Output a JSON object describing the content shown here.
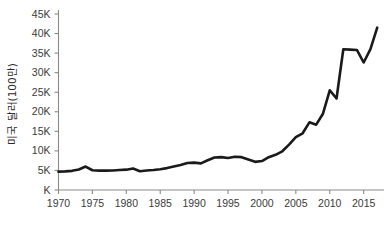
{
  "chart_data": {
    "type": "line",
    "title": "",
    "subtitle": "",
    "xlabel": "",
    "ylabel": "미국 달러(100만)",
    "xlim": [
      1970,
      2018
    ],
    "ylim": [
      0,
      45000
    ],
    "grid": false,
    "legend": false,
    "legend_position": "none",
    "line_color": "#1a1a1a",
    "axis_color": "#8a8a8a",
    "text_color": "#3a3a3a",
    "background_color": "#ffffff",
    "x_tick_labels": [
      "1970",
      "1975",
      "1980",
      "1985",
      "1990",
      "1995",
      "2000",
      "2005",
      "2010",
      "2015"
    ],
    "x_tick_values": [
      1970,
      1975,
      1980,
      1985,
      1990,
      1995,
      2000,
      2005,
      2010,
      2015
    ],
    "y_tick_labels": [
      "K",
      "5K",
      "10K",
      "15K",
      "20K",
      "25K",
      "30K",
      "35K",
      "40K",
      "45K"
    ],
    "y_tick_values": [
      0,
      5000,
      10000,
      15000,
      20000,
      25000,
      30000,
      35000,
      40000,
      45000
    ],
    "series": [
      {
        "name": "미국 달러(100만)",
        "x": [
          1970,
          1971,
          1972,
          1973,
          1974,
          1975,
          1976,
          1977,
          1978,
          1979,
          1980,
          1981,
          1982,
          1983,
          1984,
          1985,
          1986,
          1987,
          1988,
          1989,
          1990,
          1991,
          1992,
          1993,
          1994,
          1995,
          1996,
          1997,
          1998,
          1999,
          2000,
          2001,
          2002,
          2003,
          2004,
          2005,
          2006,
          2007,
          2008,
          2009,
          2010,
          2011,
          2012,
          2013,
          2014,
          2015,
          2016,
          2017
        ],
        "values": [
          4700,
          4750,
          4900,
          5250,
          6000,
          5050,
          4950,
          4950,
          5000,
          5100,
          5200,
          5500,
          4800,
          5000,
          5100,
          5300,
          5600,
          6000,
          6400,
          6900,
          7000,
          6800,
          7600,
          8300,
          8400,
          8200,
          8500,
          8400,
          7800,
          7200,
          7400,
          8400,
          9000,
          9900,
          11600,
          13500,
          14500,
          17300,
          16700,
          19500,
          25500,
          23400,
          36000,
          35900,
          35800,
          32600,
          36000,
          41500
        ]
      }
    ],
    "annotations": []
  }
}
